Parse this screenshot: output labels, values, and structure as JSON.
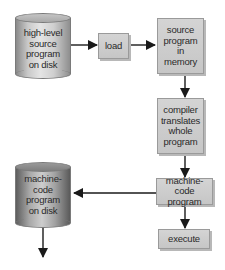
{
  "diagram": {
    "type": "flowchart",
    "nodes": {
      "source_disk": {
        "label": "high-level source program on disk",
        "lines": [
          "high-level",
          "source",
          "program",
          "on disk"
        ],
        "shape": "cylinder"
      },
      "load": {
        "label": "load",
        "lines": [
          "load"
        ],
        "shape": "box"
      },
      "source_memory": {
        "label": "source program in memory",
        "lines": [
          "source",
          "program",
          "in",
          "memory"
        ],
        "shape": "box"
      },
      "compiler": {
        "label": "compiler translates whole program",
        "lines": [
          "compiler",
          "translates",
          "whole",
          "program"
        ],
        "shape": "box"
      },
      "machine_code": {
        "label": "machine-code program",
        "lines": [
          "machine-code",
          "program"
        ],
        "shape": "box"
      },
      "machine_disk": {
        "label": "machine-code program on disk",
        "lines": [
          "machine-",
          "code",
          "program",
          "on disk"
        ],
        "shape": "cylinder"
      },
      "execute": {
        "label": "execute",
        "lines": [
          "execute"
        ],
        "shape": "box"
      }
    },
    "edges": [
      {
        "from": "source_disk",
        "to": "load"
      },
      {
        "from": "load",
        "to": "source_memory"
      },
      {
        "from": "source_memory",
        "to": "compiler"
      },
      {
        "from": "compiler",
        "to": "machine_code"
      },
      {
        "from": "machine_code",
        "to": "machine_disk"
      },
      {
        "from": "machine_code",
        "to": "execute"
      },
      {
        "from": "machine_disk",
        "to": "(off-diagram, downward)"
      }
    ],
    "colors": {
      "box_fill": "#cccccc",
      "box_border": "#9a9a9a",
      "arrow": "#1a1a1a",
      "text": "#2a2a2a",
      "background": "#ffffff"
    }
  }
}
